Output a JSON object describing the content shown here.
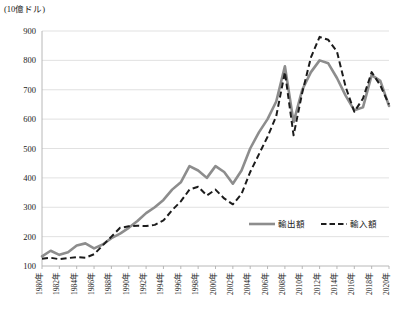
{
  "chart_data": {
    "type": "line",
    "title": "",
    "subtitle": "",
    "xlabel": "",
    "ylabel": "",
    "unit_label": "(10億ドル)",
    "grid": true,
    "legend_position": "inside-bottom-right",
    "ylim": [
      100,
      900
    ],
    "yticks": [
      100,
      200,
      300,
      400,
      500,
      600,
      700,
      800,
      900
    ],
    "ytick_labels": [
      "100",
      "200",
      "300",
      "400",
      "500",
      "600",
      "700",
      "800",
      "900"
    ],
    "xlim": [
      1980,
      2020
    ],
    "xticks": [
      1980,
      1982,
      1984,
      1986,
      1988,
      1990,
      1992,
      1994,
      1996,
      1998,
      2000,
      2002,
      2004,
      2006,
      2008,
      2010,
      2012,
      2014,
      2016,
      2018,
      2020
    ],
    "xtick_labels": [
      "1980年",
      "1982年",
      "1984年",
      "1986年",
      "1988年",
      "1990年",
      "1992年",
      "1994年",
      "1996年",
      "1998年",
      "2000年",
      "2002年",
      "2004年",
      "2006年",
      "2008年",
      "2010年",
      "2012年",
      "2014年",
      "2016年",
      "2018年",
      "2020年"
    ],
    "x": [
      1980,
      1981,
      1982,
      1983,
      1984,
      1985,
      1986,
      1987,
      1988,
      1989,
      1990,
      1991,
      1992,
      1993,
      1994,
      1995,
      1996,
      1997,
      1998,
      1999,
      2000,
      2001,
      2002,
      2003,
      2004,
      2005,
      2006,
      2007,
      2008,
      2009,
      2010,
      2011,
      2012,
      2013,
      2014,
      2015,
      2016,
      2017,
      2018,
      2019,
      2020
    ],
    "series": [
      {
        "name": "輸出額",
        "style": "solid",
        "color": "#8d8d8d",
        "values": [
          133,
          152,
          138,
          147,
          170,
          177,
          160,
          173,
          195,
          210,
          230,
          253,
          280,
          300,
          325,
          360,
          385,
          440,
          425,
          400,
          440,
          420,
          380,
          425,
          500,
          555,
          600,
          660,
          780,
          590,
          700,
          760,
          800,
          790,
          740,
          680,
          630,
          640,
          750,
          730,
          645
        ]
      },
      {
        "name": "輸入額",
        "style": "dashed",
        "color": "#1c1c1c",
        "values": [
          125,
          128,
          123,
          127,
          130,
          128,
          140,
          170,
          200,
          230,
          235,
          237,
          236,
          240,
          255,
          290,
          320,
          360,
          370,
          340,
          360,
          330,
          310,
          345,
          420,
          480,
          540,
          610,
          760,
          545,
          690,
          810,
          880,
          870,
          830,
          710,
          625,
          670,
          760,
          715,
          650
        ]
      }
    ]
  },
  "legend": {
    "items": [
      {
        "label": "輸出額",
        "style": "solid"
      },
      {
        "label": "輸入額",
        "style": "dashed"
      }
    ]
  }
}
